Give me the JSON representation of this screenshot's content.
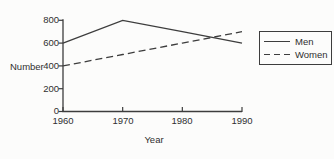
{
  "chart_data": {
    "type": "line",
    "title": "",
    "xlabel": "Year",
    "ylabel": "Number",
    "x": [
      1960,
      1970,
      1980,
      1990
    ],
    "x_labels": [
      "1960",
      "1970",
      "1980",
      "1990"
    ],
    "yticks": [
      0,
      200,
      400,
      600,
      800
    ],
    "ytick_labels": [
      "0",
      "200",
      "400",
      "600",
      "800"
    ],
    "xlim": [
      1960,
      1990
    ],
    "ylim": [
      0,
      820
    ],
    "grid": false,
    "legend_position": "right",
    "series": [
      {
        "name": "Men",
        "style": "solid",
        "values": [
          600,
          800,
          700,
          600
        ]
      },
      {
        "name": "Women",
        "style": "dashed",
        "values": [
          400,
          500,
          600,
          700
        ]
      }
    ]
  },
  "colors": {
    "line": "#3d3d3d",
    "text": "#2f2f2f",
    "background": "#fcfcfb"
  }
}
